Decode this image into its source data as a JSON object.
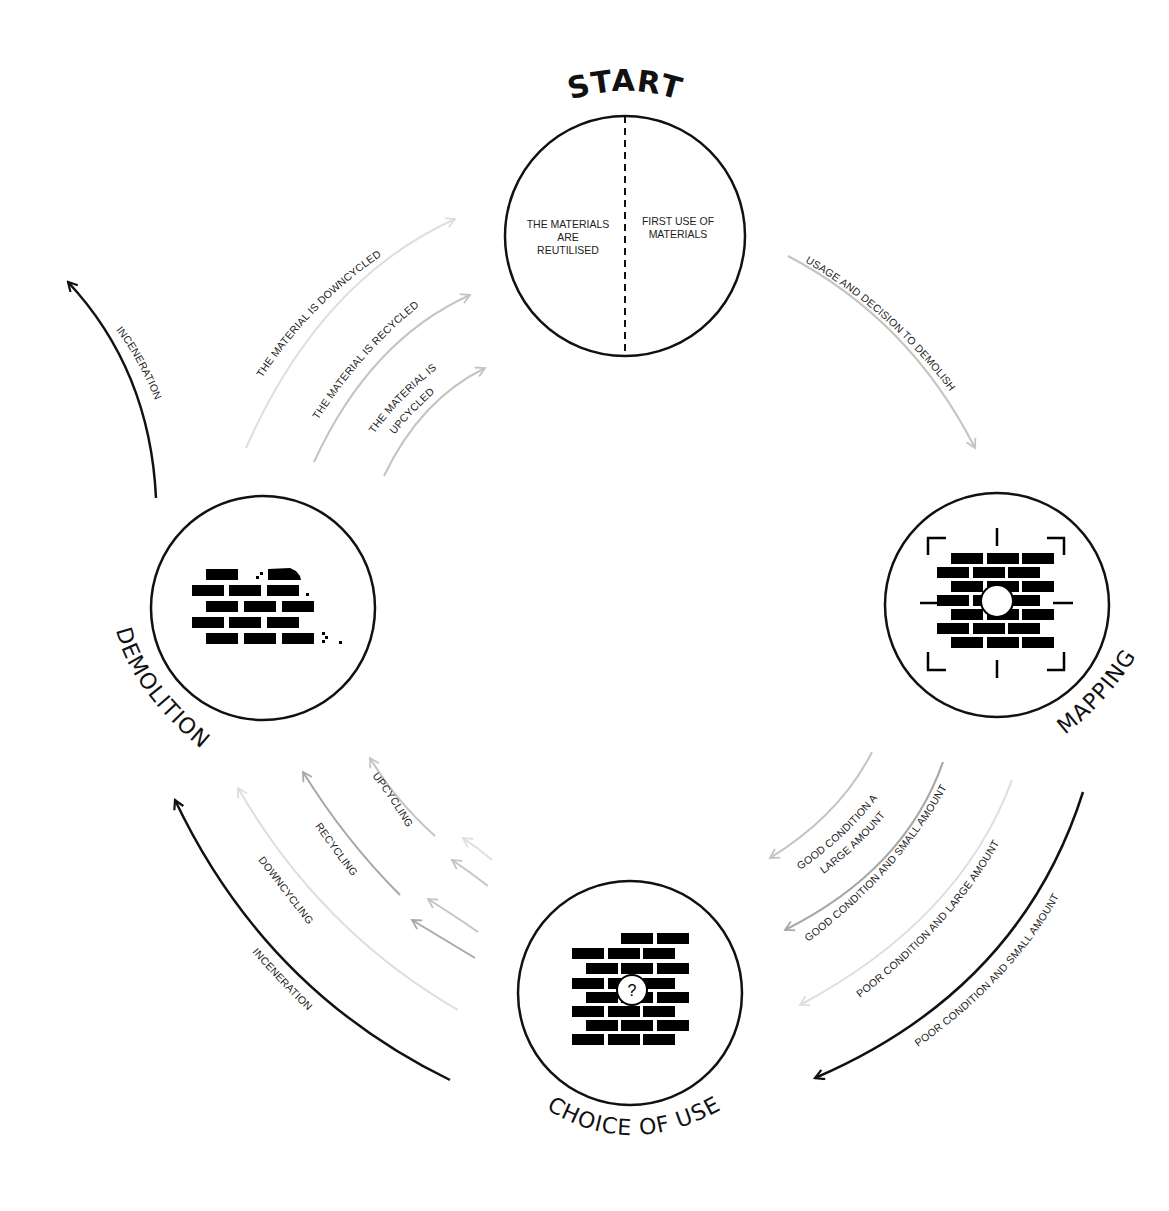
{
  "title": "START",
  "colors": {
    "black": "#111111",
    "dark_gray": "#a8a8a8",
    "mid_gray": "#c4c4c4",
    "light_gray": "#dedede"
  },
  "nodes": {
    "start": {
      "label": "START",
      "left_text": [
        "THE MATERIALS",
        "ARE",
        "REUTILISED"
      ],
      "right_text": [
        "FIRST USE OF",
        "MATERIALS"
      ]
    },
    "mapping": {
      "label": "MAPPING",
      "icon": "brick-wall-target-icon"
    },
    "choice_of_use": {
      "label": "CHOICE OF USE",
      "icon": "brick-wall-question-icon",
      "question_mark": "?"
    },
    "demolition": {
      "label": "DEMOLITION",
      "icon": "crumbling-brick-wall-icon"
    }
  },
  "arrows": {
    "start_to_mapping": "USAGE AND DECISION TO DEMOLISH",
    "mapping_to_choice": [
      "GOOD CONDITION AND LARGE AMOUNT",
      "GOOD CONDITION AND SMALL AMOUNT",
      "POOR CONDITION AND LARGE AMOUNT",
      "POOR CONDITION AND SMALL AMOUNT"
    ],
    "mapping_to_choice_lines": {
      "good_large": [
        "GOOD CONDITION AND",
        "LARGE AMOUNT"
      ]
    },
    "choice_to_demolition": [
      "UPCYCLING",
      "RECYCLING",
      "DOWNCYCLING",
      "INCENERATION"
    ],
    "demolition_to_start": [
      "THE MATERIAL IS DOWNCYCLED",
      "THE MATERIAL IS RECYCLED",
      "THE MATERIAL IS UPCYCLED"
    ],
    "demolition_to_start_lines": {
      "upcycled": [
        "THE MATERIAL IS",
        "UPCYCLED"
      ]
    },
    "demolition_exit": "INCENERATION"
  }
}
